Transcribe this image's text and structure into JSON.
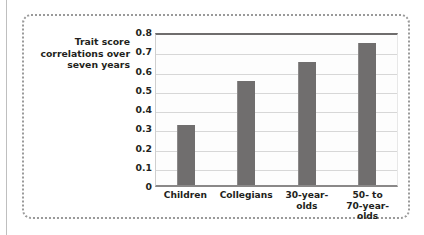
{
  "figure": {
    "frame_style": "dotted-rounded",
    "frame_color": "#9a9a9a",
    "bar_color": "#706e6e",
    "gridline_color": "#d7d7d7",
    "plot_background": "#fdfdfd"
  },
  "chart_data": {
    "type": "bar",
    "title": "",
    "xlabel": "",
    "ylabel": "Trait score correlations over seven years",
    "ylabel_lines": [
      "Trait score",
      "correlations over",
      "seven years"
    ],
    "categories": [
      "Children",
      "Collegians",
      "30-year-olds",
      "50- to 70-year-olds"
    ],
    "category_lines": [
      [
        "Children"
      ],
      [
        "Collegians"
      ],
      [
        "30-year-",
        "olds"
      ],
      [
        "50- to",
        "70-year-olds"
      ]
    ],
    "values": [
      0.31,
      0.54,
      0.64,
      0.74
    ],
    "ylim": [
      0,
      0.8
    ],
    "ytick_values": [
      0,
      0.1,
      0.2,
      0.3,
      0.4,
      0.5,
      0.6,
      0.7,
      0.8
    ],
    "ytick_labels": [
      "0",
      "0.1",
      "0.2",
      "0.3",
      "0.4",
      "0.5",
      "0.6",
      "0.7",
      "0.8"
    ],
    "grid": true,
    "grid_axis": "y",
    "legend": false,
    "legend_position": "none"
  }
}
